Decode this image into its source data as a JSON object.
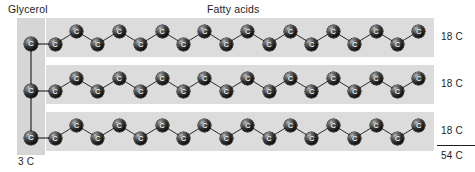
{
  "figure": {
    "title_glycerol": "Glycerol",
    "title_fatty_acids": "Fatty acids",
    "glycerol_count_label": "3 C",
    "atom_symbol": "C",
    "colors": {
      "background": "#ffffff",
      "glycerol_band": "#d6d6d6",
      "chain_band": "#dcdcdc",
      "atom_dark": "#101010",
      "atom_highlight": "#c9c9c9",
      "bond": "#2b2b2b",
      "text": "#1d1d1d"
    },
    "glycerol": {
      "label": "Glycerol",
      "carbon_count": 3,
      "count_label": "3 C",
      "atoms": [
        {
          "x": 31,
          "y": 44,
          "symbol": "C"
        },
        {
          "x": 31,
          "y": 91,
          "symbol": "C"
        },
        {
          "x": 31,
          "y": 138,
          "symbol": "C"
        }
      ]
    },
    "chains": [
      {
        "name": "fatty-acid-chain-1",
        "count_label": "18 C",
        "carbon_count": 18,
        "band": {
          "x": 46,
          "y": 18,
          "width": 388,
          "height": 39
        },
        "start_x": 55,
        "step_x": 21.4,
        "y_low": 44,
        "y_high": 31
      },
      {
        "name": "fatty-acid-chain-2",
        "count_label": "18 C",
        "carbon_count": 18,
        "band": {
          "x": 46,
          "y": 65,
          "width": 388,
          "height": 39
        },
        "start_x": 55,
        "step_x": 21.4,
        "y_low": 91,
        "y_high": 78
      },
      {
        "name": "fatty-acid-chain-3",
        "count_label": "18 C",
        "carbon_count": 18,
        "band": {
          "x": 46,
          "y": 112,
          "width": 388,
          "height": 39
        },
        "start_x": 55,
        "step_x": 21.4,
        "y_low": 138,
        "y_high": 125
      }
    ],
    "totals": {
      "sum_label": "54 C",
      "sum_value": 54,
      "rule_visible": true
    }
  },
  "chart_data": {
    "type": "diagram",
    "categories": [
      "Glycerol",
      "Fatty acid 1",
      "Fatty acid 2",
      "Fatty acid 3"
    ],
    "values": [
      3,
      18,
      18,
      18
    ],
    "labels": [
      "3 C",
      "18 C",
      "18 C",
      "18 C"
    ],
    "total": 54,
    "total_label": "54 C",
    "xlabel": "",
    "ylabel": "Carbon atoms"
  }
}
